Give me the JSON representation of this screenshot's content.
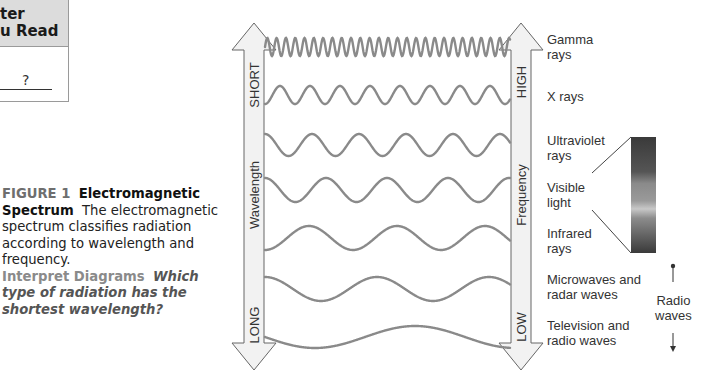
{
  "side_table": {
    "header_line1": "ter",
    "header_line2": "u Read",
    "cell_value": "?"
  },
  "caption": {
    "figure_label": "FIGURE 1",
    "figure_title": "Electromagnetic Spectrum",
    "description": "The electromagnetic spectrum classifies radiation according to wavelength and frequency.",
    "prompt_label": "Interpret Diagrams",
    "prompt_question": "Which type of radiation has the shortest wavelength?"
  },
  "diagram": {
    "wavelength_axis": {
      "label": "Wavelength",
      "top": "SHORT",
      "bottom": "LONG"
    },
    "frequency_axis": {
      "label": "Frequency",
      "top": "HIGH",
      "bottom": "LOW"
    },
    "bands": [
      {
        "line1": "Gamma",
        "line2": "rays"
      },
      {
        "line1": "X rays",
        "line2": ""
      },
      {
        "line1": "Ultraviolet",
        "line2": "rays"
      },
      {
        "line1": "Visible",
        "line2": "light"
      },
      {
        "line1": "Infrared",
        "line2": "rays"
      },
      {
        "line1": "Microwaves and",
        "line2": "radar waves"
      },
      {
        "line1": "Television and",
        "line2": "radio waves"
      }
    ],
    "radio_group": {
      "line1": "Radio",
      "line2": "waves"
    },
    "colors": {
      "wave": "#8a8a8a",
      "arrow_fill": "#f2f2f2",
      "arrow_stroke": "#666666"
    }
  }
}
